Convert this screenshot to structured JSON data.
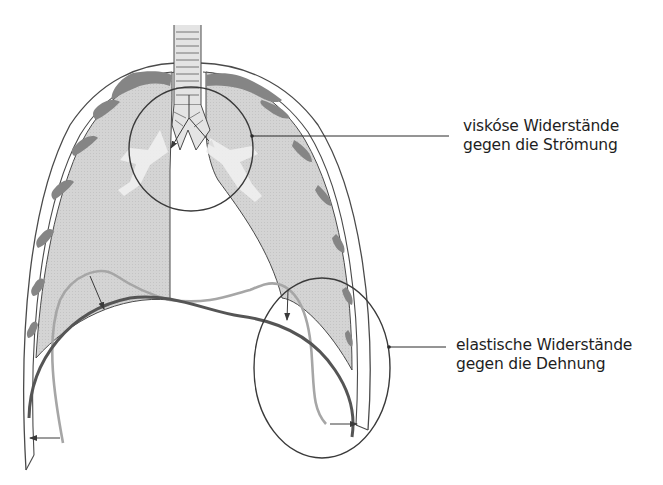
{
  "figure": {
    "colors": {
      "lung_fill": "#d2d2d2",
      "rib": "#808080",
      "outline": "#4a4a4a",
      "airway_highlight": "#f2f2f2",
      "diaphragm_expiration": "#a8a8a8",
      "diaphragm_inspiration": "#5a5a5a",
      "callout_line": "#2a2a2a"
    }
  },
  "callouts": [
    {
      "id": "viscous",
      "line1": "viskóse Widerstände",
      "line2": "gegen die Strömung",
      "target": "bronchial tree (circled)"
    },
    {
      "id": "elastic",
      "line1": "elastische Widerstände",
      "line2": "gegen die Dehnung",
      "target": "chest wall / diaphragm (circled)"
    }
  ]
}
